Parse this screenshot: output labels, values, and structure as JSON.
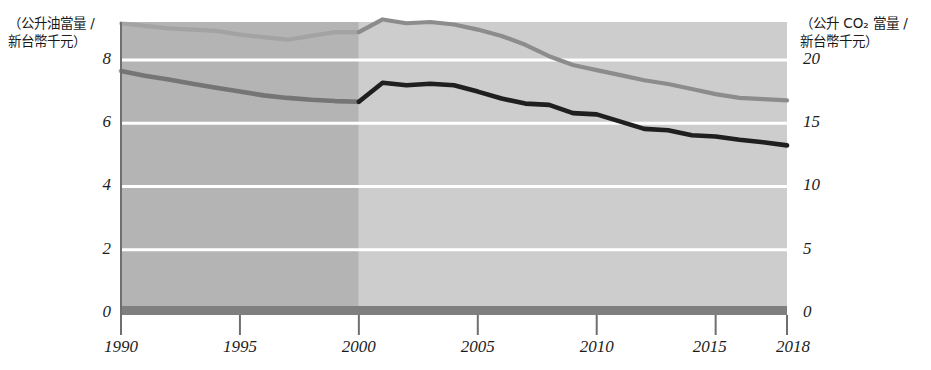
{
  "chart_data": {
    "type": "line",
    "title": "",
    "subtitle": "",
    "xlabel": "",
    "ylabel": "(公升油當量 / 新台幣千元)",
    "y2label": "(公升 CO₂ 當量 / 新台幣千元)",
    "grid": true,
    "legend_position": "none",
    "x": [
      1990,
      1991,
      1992,
      1993,
      1994,
      1995,
      1996,
      1997,
      1998,
      1999,
      2000,
      2001,
      2002,
      2003,
      2004,
      2005,
      2006,
      2007,
      2008,
      2009,
      2010,
      2011,
      2012,
      2013,
      2014,
      2015,
      2016,
      2017,
      2018
    ],
    "xlim": [
      1990,
      2018
    ],
    "xticks": [
      1990,
      1995,
      2000,
      2005,
      2010,
      2015,
      2018
    ],
    "xticklabels": [
      "1990",
      "1995",
      "2000",
      "2005",
      "2010",
      "2015",
      "2018"
    ],
    "ylim": [
      0,
      9.2
    ],
    "yticks": [
      0,
      2,
      4,
      6,
      8
    ],
    "yticklabels": [
      "0",
      "2",
      "4",
      "6",
      "8"
    ],
    "y2lim": [
      0,
      23
    ],
    "y2ticks": [
      0,
      5,
      10,
      15,
      20
    ],
    "y2ticklabels": [
      "0",
      "5",
      "10",
      "15",
      "20"
    ],
    "series": [
      {
        "name": "公升 CO2 當量 / 新台幣千元",
        "axis": "right",
        "color": "#8c8c8c",
        "values": [
          22.9,
          22.7,
          22.5,
          22.4,
          22.3,
          22.0,
          21.8,
          21.6,
          21.9,
          22.2,
          22.2,
          23.2,
          22.9,
          23.0,
          22.8,
          22.4,
          21.9,
          21.2,
          20.3,
          19.6,
          19.2,
          18.8,
          18.4,
          18.1,
          17.7,
          17.3,
          17.0,
          16.9,
          16.8
        ]
      },
      {
        "name": "公升油當量 / 新台幣千元",
        "axis": "left",
        "color": "#1f1f1f",
        "values": [
          7.65,
          7.5,
          7.38,
          7.25,
          7.12,
          7.0,
          6.88,
          6.8,
          6.74,
          6.7,
          6.68,
          7.28,
          7.2,
          7.25,
          7.2,
          7.0,
          6.78,
          6.62,
          6.58,
          6.32,
          6.28,
          6.05,
          5.82,
          5.78,
          5.62,
          5.58,
          5.48,
          5.4,
          5.3
        ]
      }
    ],
    "annotations": [
      {
        "name": "historical-shaded-band",
        "x_start": 1990,
        "x_end": 2000,
        "color": "#b4b4b4",
        "label": ""
      },
      {
        "name": "recent-shaded-band",
        "x_start": 2000,
        "x_end": 2018,
        "color": "#cdcdcd",
        "label": ""
      }
    ],
    "colors": {
      "gridline": "#ffffff",
      "axis_line": "#6f6f6f",
      "baseline_band": "#7f7f7f",
      "band_early": "#b4b4b4",
      "band_late": "#cdcdcd",
      "series_co2": "#8c8c8c",
      "series_oil": "#1f1f1f",
      "text": "#1c1c1c"
    }
  },
  "axes": {
    "left_caption": "（公升油當量 /\n新台幣千元）",
    "right_caption": "（公升 CO₂ 當量 /\n新台幣千元）",
    "left_ticks": [
      "8",
      "6",
      "4",
      "2",
      "0"
    ],
    "right_ticks": [
      "20",
      "15",
      "10",
      "5",
      "0"
    ],
    "x_ticks": [
      "1990",
      "1995",
      "2000",
      "2005",
      "2010",
      "2015",
      "2018"
    ]
  }
}
